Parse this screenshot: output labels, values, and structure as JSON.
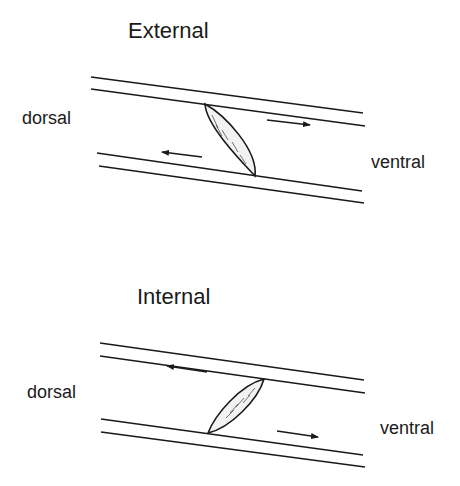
{
  "panels": [
    {
      "title": "External",
      "left_label": "dorsal",
      "right_label": "ventral",
      "upper_arrow_direction": "right",
      "lower_arrow_direction": "left"
    },
    {
      "title": "Internal",
      "left_label": "dorsal",
      "right_label": "ventral",
      "upper_arrow_direction": "left",
      "lower_arrow_direction": "right"
    }
  ],
  "colors": {
    "stroke": "#1a1a1a",
    "background": "#ffffff"
  }
}
